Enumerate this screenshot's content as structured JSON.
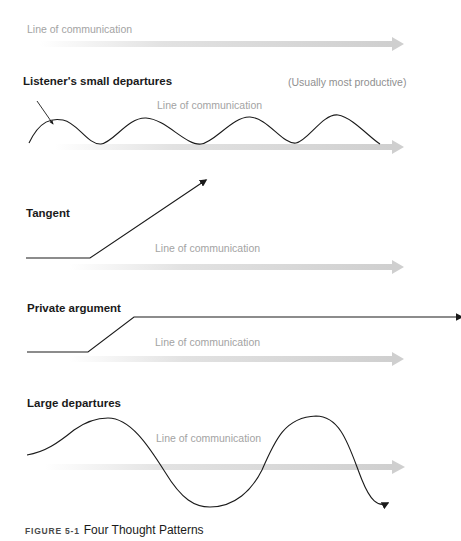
{
  "figure": {
    "label": "FIGURE 5-1",
    "title": "Four Thought Patterns"
  },
  "colors": {
    "line": "#1a1a1a",
    "communication_arrow": "#d0d0d0",
    "muted_text": "#a3a3a3"
  },
  "baseline": {
    "label": "Line of communication"
  },
  "patterns": [
    {
      "title": "Listener's small departures",
      "note": "(Usually most productive)",
      "line_label": "Line of communication"
    },
    {
      "title": "Tangent",
      "line_label": "Line of communication"
    },
    {
      "title": "Private argument",
      "line_label": "Line of communication"
    },
    {
      "title": "Large departures",
      "line_label": "Line of communication"
    }
  ]
}
